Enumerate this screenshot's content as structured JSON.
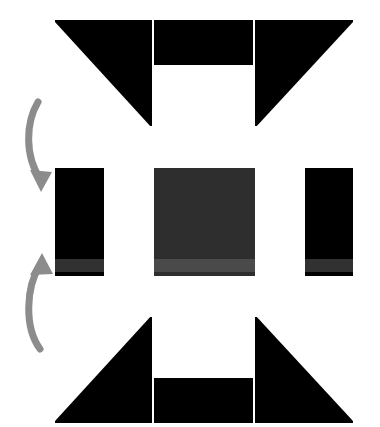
{
  "figure": {
    "title": "",
    "background_color": "#ffffff",
    "width": 380,
    "height": 427
  },
  "colors": {
    "black": "#000000",
    "white": "#ffffff",
    "dark_gray_block": "#2e2e2e",
    "mid_gray_band": "#3a3a3a",
    "light_gray_band": "#4a4a4a",
    "arrow_gray": "#8c8c8c"
  },
  "panels": [
    {
      "id": "panel-top",
      "name": "top-pattern-panel",
      "label": "",
      "background": "#000000",
      "cells": [
        {
          "name": "left-cell",
          "shape": "triangle-lower-left",
          "fill": "#ffffff"
        },
        {
          "name": "center-cell",
          "shape": "rectangle-bottom",
          "fill": "#ffffff"
        },
        {
          "name": "right-cell",
          "shape": "triangle-lower-right",
          "fill": "#ffffff"
        }
      ]
    },
    {
      "id": "panel-mid",
      "name": "middle-pattern-panel",
      "label": "",
      "background": "#000000",
      "cells": [
        {
          "name": "left-bar",
          "shape": "vertical-bar",
          "fill": "#ffffff"
        },
        {
          "name": "center-block",
          "shape": "rectangle",
          "fill": "#2e2e2e"
        },
        {
          "name": "right-bar",
          "shape": "vertical-bar",
          "fill": "#ffffff"
        }
      ]
    },
    {
      "id": "panel-bot",
      "name": "bottom-pattern-panel",
      "label": "",
      "background": "#000000",
      "cells": [
        {
          "name": "left-cell",
          "shape": "triangle-upper-left",
          "fill": "#ffffff"
        },
        {
          "name": "center-cell",
          "shape": "rectangle-top",
          "fill": "#ffffff"
        },
        {
          "name": "right-cell",
          "shape": "triangle-upper-right",
          "fill": "#ffffff"
        }
      ]
    }
  ],
  "arrows": [
    {
      "id": "arrow-down",
      "name": "arrow-top-to-middle",
      "direction": "down",
      "color": "#8c8c8c",
      "label": ""
    },
    {
      "id": "arrow-up",
      "name": "arrow-bottom-to-middle",
      "direction": "up",
      "color": "#8c8c8c",
      "label": ""
    }
  ]
}
